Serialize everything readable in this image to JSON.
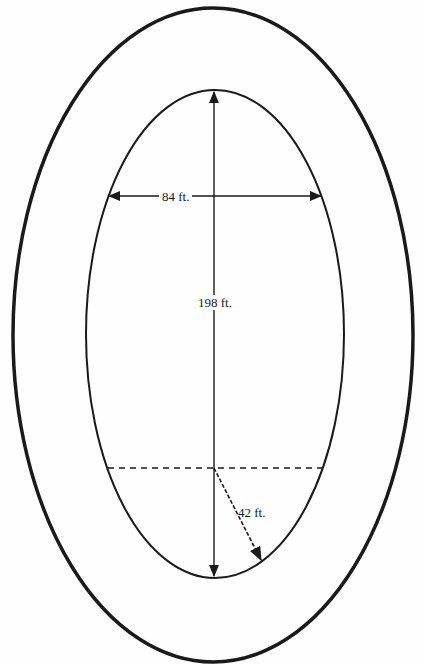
{
  "diagram": {
    "title": "",
    "shape": "oval track (ellipse within ellipse)",
    "colors": {
      "stroke": "#1a1a1a",
      "background": "#fefefe"
    },
    "outer_ellipse": {
      "cx": 213,
      "cy": 335,
      "rx": 200,
      "ry": 327,
      "stroke_width": 3.5
    },
    "inner_ellipse": {
      "cx": 215,
      "cy": 334,
      "rx": 129,
      "ry": 244,
      "stroke_width": 2
    },
    "dimensions": {
      "width": {
        "label": "84 ft.",
        "value": 84,
        "unit": "ft.",
        "orientation": "horizontal"
      },
      "length": {
        "label": "198 ft.",
        "value": 198,
        "unit": "ft.",
        "orientation": "vertical"
      },
      "radius": {
        "label": "42 ft.",
        "value": 42,
        "unit": "ft.",
        "orientation": "diagonal-dashed"
      }
    },
    "guides": {
      "dashed_chord": "horizontal dashed line marking the center of the bottom semicircular end"
    }
  }
}
